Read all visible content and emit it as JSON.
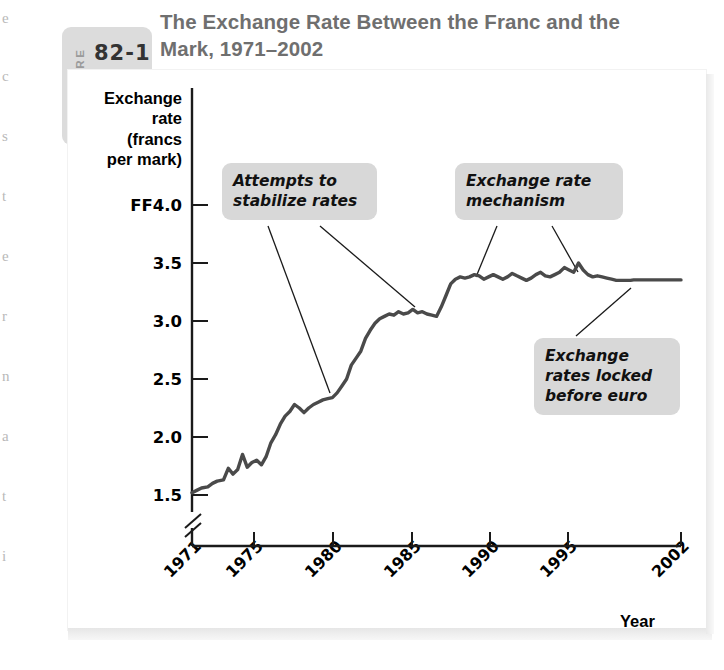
{
  "figure": {
    "word": "FIGURE",
    "number": "82-1",
    "title": "The Exchange Rate Between the Franc and the Mark, 1971–2002"
  },
  "axes": {
    "ylabel": "Exchange rate (francs per mark)",
    "ylabel_lines": [
      "Exchange",
      "rate",
      "(francs",
      "per mark)"
    ],
    "xlabel": "Year",
    "yticks": [
      "FF4.0",
      "3.5",
      "3.0",
      "2.5",
      "2.0",
      "1.5"
    ],
    "xticks": [
      "1971",
      "1975",
      "1980",
      "1985",
      "1990",
      "1995",
      "2002"
    ],
    "axis_break": true
  },
  "annotations": [
    {
      "id": "stabilize",
      "lines": [
        "Attempts to",
        "stabilize rates"
      ]
    },
    {
      "id": "erm",
      "lines": [
        "Exchange rate",
        "mechanism"
      ]
    },
    {
      "id": "locked",
      "lines": [
        "Exchange",
        "rates locked",
        "before euro"
      ]
    }
  ],
  "colors": {
    "line": "#4a4a4a",
    "callout_bg": "#d8d8d8",
    "title": "#6f6f6f",
    "figure_tag_bg": "#dcdcdc",
    "axis": "#1a1a1a"
  },
  "chart_data": {
    "type": "line",
    "title": "The Exchange Rate Between the Franc and the Mark, 1971–2002",
    "xlabel": "Year",
    "ylabel": "Exchange rate (francs per mark)",
    "xlim": [
      1971,
      2002
    ],
    "ylim": [
      1.5,
      4.0
    ],
    "ytick_values": [
      4.0,
      3.5,
      3.0,
      2.5,
      2.0,
      1.5
    ],
    "ytick_labels": [
      "FF4.0",
      "3.5",
      "3.0",
      "2.5",
      "2.0",
      "1.5"
    ],
    "xtick_values": [
      1971,
      1975,
      1980,
      1985,
      1990,
      1995,
      2002
    ],
    "xtick_labels": [
      "1971",
      "1975",
      "1980",
      "1985",
      "1990",
      "1995",
      "2002"
    ],
    "grid": false,
    "legend": false,
    "axis_break_below": 1.5,
    "series": [
      {
        "name": "Francs per mark",
        "x": [
          1971.0,
          1971.3,
          1971.6,
          1972.0,
          1972.3,
          1972.6,
          1973.0,
          1973.3,
          1973.6,
          1973.9,
          1974.2,
          1974.5,
          1974.8,
          1975.1,
          1975.4,
          1975.7,
          1976.0,
          1976.3,
          1976.6,
          1976.9,
          1977.2,
          1977.5,
          1977.8,
          1978.1,
          1978.4,
          1978.7,
          1979.0,
          1979.3,
          1979.6,
          1979.9,
          1980.2,
          1980.5,
          1980.8,
          1981.1,
          1981.4,
          1981.7,
          1982.0,
          1982.3,
          1982.6,
          1982.9,
          1983.2,
          1983.5,
          1983.8,
          1984.1,
          1984.4,
          1984.7,
          1985.0,
          1985.3,
          1985.6,
          1985.9,
          1986.2,
          1986.5,
          1986.8,
          1987.1,
          1987.4,
          1987.7,
          1988.0,
          1988.3,
          1988.6,
          1988.9,
          1989.2,
          1989.5,
          1989.8,
          1990.1,
          1990.4,
          1990.7,
          1991.0,
          1991.3,
          1991.6,
          1991.9,
          1992.2,
          1992.5,
          1992.8,
          1993.1,
          1993.4,
          1993.7,
          1994.0,
          1994.3,
          1994.6,
          1994.9,
          1995.2,
          1995.5,
          1995.8,
          1996.1,
          1996.4,
          1996.7,
          1997.0,
          1997.3,
          1997.6,
          1997.9,
          1998.2,
          1998.5,
          1998.8,
          1999.0,
          2000.0,
          2001.0,
          2002.0
        ],
        "y": [
          1.52,
          1.54,
          1.56,
          1.57,
          1.6,
          1.62,
          1.63,
          1.73,
          1.68,
          1.72,
          1.85,
          1.74,
          1.78,
          1.8,
          1.76,
          1.83,
          1.95,
          2.02,
          2.11,
          2.18,
          2.22,
          2.28,
          2.25,
          2.21,
          2.25,
          2.28,
          2.3,
          2.32,
          2.33,
          2.34,
          2.38,
          2.44,
          2.5,
          2.62,
          2.68,
          2.74,
          2.85,
          2.92,
          2.98,
          3.02,
          3.04,
          3.06,
          3.05,
          3.08,
          3.06,
          3.07,
          3.1,
          3.07,
          3.08,
          3.06,
          3.05,
          3.04,
          3.12,
          3.22,
          3.32,
          3.36,
          3.38,
          3.37,
          3.38,
          3.4,
          3.39,
          3.36,
          3.38,
          3.4,
          3.38,
          3.36,
          3.38,
          3.41,
          3.39,
          3.37,
          3.35,
          3.37,
          3.4,
          3.42,
          3.39,
          3.38,
          3.4,
          3.42,
          3.46,
          3.44,
          3.42,
          3.5,
          3.44,
          3.4,
          3.38,
          3.39,
          3.38,
          3.37,
          3.36,
          3.35,
          3.35,
          3.35,
          3.35,
          3.3539,
          3.3539,
          3.3539,
          3.3539
        ]
      }
    ]
  }
}
